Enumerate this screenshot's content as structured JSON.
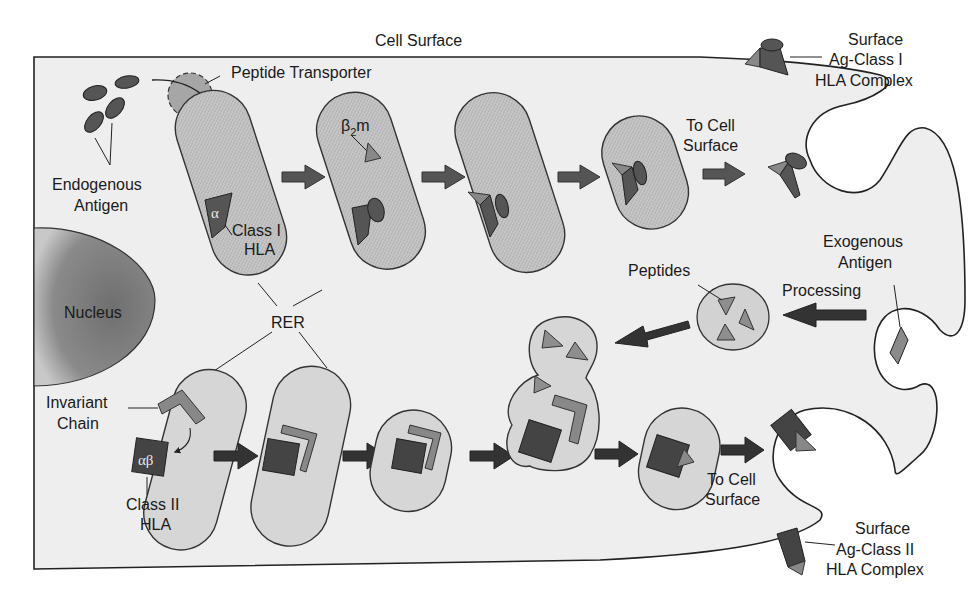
{
  "diagram": {
    "type": "antigen-processing-pathway",
    "labels": {
      "cell_surface": "Cell Surface",
      "peptide_transporter": "Peptide Transporter",
      "endogenous_antigen_line1": "Endogenous",
      "endogenous_antigen_line2": "Antigen",
      "alpha": "α",
      "class1_hla_line1": "Class I",
      "class1_hla_line2": "HLA",
      "beta2m_base": "β",
      "beta2m_sub": "2",
      "beta2m_suffix": "m",
      "to_cell_surface_top_line1": "To Cell",
      "to_cell_surface_top_line2": "Surface",
      "surface_class1_line1": "Surface",
      "surface_class1_line2": "Ag-Class I",
      "surface_class1_line3": "HLA Complex",
      "nucleus": "Nucleus",
      "rer": "RER",
      "exogenous_antigen_line1": "Exogenous",
      "exogenous_antigen_line2": "Antigen",
      "processing": "Processing",
      "peptides": "Peptides",
      "invariant_chain_line1": "Invariant",
      "invariant_chain_line2": "Chain",
      "alphabeta": "αβ",
      "class2_hla_line1": "Class II",
      "class2_hla_line2": "HLA",
      "to_cell_surface_bottom_line1": "To Cell",
      "to_cell_surface_bottom_line2": "Surface",
      "surface_class2_line1": "Surface",
      "surface_class2_line2": "Ag-Class II",
      "surface_class2_line3": "HLA Complex"
    },
    "pathways": [
      {
        "name": "Class I (endogenous)",
        "steps": [
          "Endogenous Antigen",
          "Peptide Transporter",
          "RER: Class I HLA (α)",
          "β2m association",
          "Peptide binding",
          "Vesicle",
          "To Cell Surface",
          "Surface Ag-Class I HLA Complex"
        ]
      },
      {
        "name": "Class II (exogenous)",
        "steps": [
          "Exogenous Antigen",
          "Processing",
          "Peptides",
          "RER: Class II HLA (αβ) + Invariant Chain",
          "Vesicle",
          "Fusion with peptide vesicle",
          "To Cell Surface",
          "Surface Ag-Class II HLA Complex"
        ]
      }
    ],
    "colors": {
      "cytoplasm": "#eeeeee",
      "organelle_dark": "#c4c4c4",
      "organelle_light": "#d8d8d8",
      "molecule_dark": "#4a4a4a",
      "molecule_mid": "#7a7a7a",
      "molecule_light": "#9a9a9a",
      "arrow": "#3a3a3a",
      "outline": "#222222"
    }
  }
}
